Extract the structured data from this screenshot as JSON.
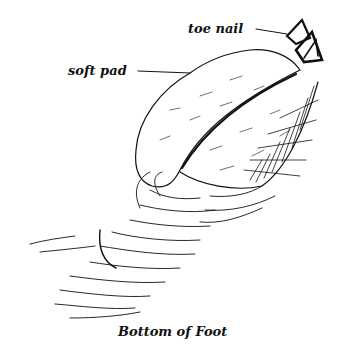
{
  "figure": {
    "caption": "Bottom of Foot",
    "labels": [
      {
        "text": "toe nail",
        "target": "toe-nail"
      },
      {
        "text": "soft pad",
        "target": "soft-pad"
      }
    ],
    "colors": {
      "ink": "#111111",
      "background": "#ffffff"
    }
  }
}
